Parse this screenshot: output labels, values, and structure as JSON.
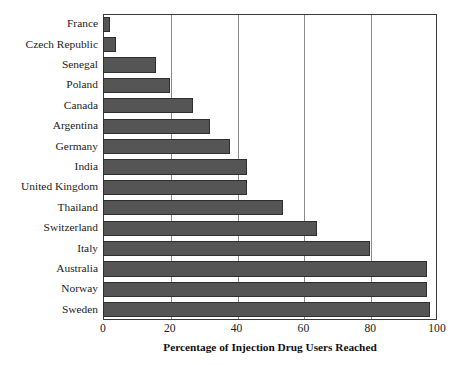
{
  "chart_data": {
    "type": "bar",
    "orientation": "horizontal",
    "title": "",
    "xlabel": "Percentage of Injection Drug Users Reached",
    "ylabel": "",
    "xlim": [
      0,
      100
    ],
    "xticks": [
      0,
      20,
      40,
      60,
      80,
      100
    ],
    "xtick_labels": [
      "0",
      "20",
      "40",
      "60",
      "80",
      "100"
    ],
    "grid": "vertical",
    "legend": "none",
    "bar_color": "#555555",
    "bar_edge_color": "#2f2f2f",
    "frame_color": "#3a3a3a",
    "gridline_color": "#8a8a8a",
    "categories": [
      "France",
      "Czech Republic",
      "Senegal",
      "Poland",
      "Canada",
      "Argentina",
      "Germany",
      "India",
      "United Kingdom",
      "Thailand",
      "Switzerland",
      "Italy",
      "Australia",
      "Norway",
      "Sweden"
    ],
    "values": [
      2,
      4,
      16,
      20,
      27,
      32,
      38,
      43,
      43,
      54,
      64,
      80,
      97,
      97,
      98
    ]
  }
}
